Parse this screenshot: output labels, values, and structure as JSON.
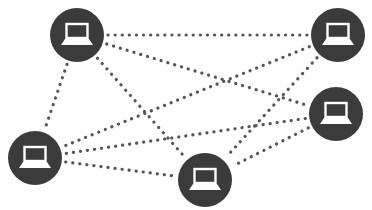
{
  "diagram": {
    "type": "network-mesh",
    "colors": {
      "node_fill": "#3b3b3b",
      "icon": "#ffffff",
      "link": "#555555",
      "background": "#ffffff"
    },
    "nodes": [
      {
        "id": "top-left",
        "icon": "laptop-icon",
        "cx": 77,
        "cy": 35,
        "r": 27
      },
      {
        "id": "top-right",
        "icon": "laptop-icon",
        "cx": 338,
        "cy": 35,
        "r": 27
      },
      {
        "id": "right-middle",
        "icon": "laptop-icon",
        "cx": 336,
        "cy": 114,
        "r": 27
      },
      {
        "id": "bottom-left",
        "icon": "laptop-icon",
        "cx": 35,
        "cy": 158,
        "r": 27
      },
      {
        "id": "bottom-middle",
        "icon": "laptop-icon",
        "cx": 205,
        "cy": 180,
        "r": 27
      }
    ],
    "links": [
      {
        "from": "top-left",
        "to": "top-right",
        "style": "dotted"
      },
      {
        "from": "top-left",
        "to": "right-middle",
        "style": "dotted"
      },
      {
        "from": "top-left",
        "to": "bottom-middle",
        "style": "dotted"
      },
      {
        "from": "top-left",
        "to": "bottom-left",
        "style": "dotted"
      },
      {
        "from": "top-right",
        "to": "bottom-left",
        "style": "dotted"
      },
      {
        "from": "top-right",
        "to": "bottom-middle",
        "style": "dotted"
      },
      {
        "from": "right-middle",
        "to": "bottom-left",
        "style": "dotted"
      },
      {
        "from": "right-middle",
        "to": "bottom-middle",
        "style": "dotted"
      },
      {
        "from": "bottom-left",
        "to": "bottom-middle",
        "style": "dotted"
      }
    ]
  }
}
